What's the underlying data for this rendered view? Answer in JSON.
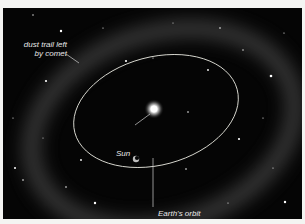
{
  "illustration": {
    "subject": "Earth's orbit passing through a comet dust trail around the Sun",
    "labels": {
      "dust_trail_line1": "dust trail left",
      "dust_trail_line2": "by comet",
      "sun": "Sun",
      "earth_orbit": "Earth's orbit"
    },
    "colors": {
      "background": "#050505",
      "frame": "#f4f4f2",
      "orbit_line": "#d8d8d0",
      "label_text": "#e8e8e8",
      "sun_glow": "#ffffff"
    }
  }
}
